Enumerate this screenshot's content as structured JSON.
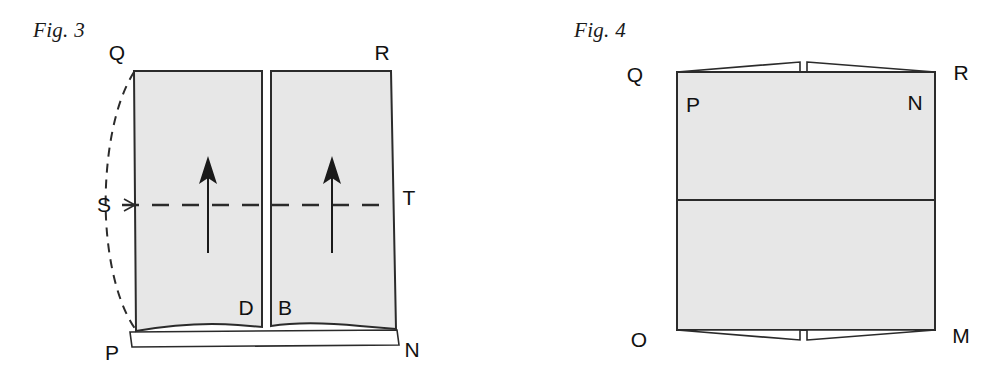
{
  "plate": {
    "background_color": "#ffffff",
    "width": 982,
    "height": 380
  },
  "style": {
    "panel_fill": "#e7e7e7",
    "stroke_color": "#2b2b2b",
    "label_color": "#111111",
    "caption_color": "#1a1a1a"
  },
  "figures": [
    {
      "id": "figure-3",
      "caption": "Fig. 3",
      "description": "Two shaded vertical panels separated by a narrow central gap, each containing an upward arrow, crossed by a horizontal dashed centre line from S to T, with a dashed curved outline bulging to the left of edge QP.",
      "vertex_labels": [
        {
          "name": "Q",
          "text": "Q",
          "x": 117,
          "y": 60,
          "position": "outside-top-left"
        },
        {
          "name": "R",
          "text": "R",
          "x": 382,
          "y": 60,
          "position": "outside-top-right"
        },
        {
          "name": "S",
          "text": "S",
          "x": 104,
          "y": 212,
          "position": "outside-left-middle"
        },
        {
          "name": "T",
          "text": "T",
          "x": 409,
          "y": 205,
          "position": "outside-right-middle"
        },
        {
          "name": "D",
          "text": "D",
          "x": 246,
          "y": 315,
          "position": "inside-left-panel-bottom"
        },
        {
          "name": "B",
          "text": "B",
          "x": 278,
          "y": 315,
          "position": "inside-right-panel-bottom"
        },
        {
          "name": "P",
          "text": "P",
          "x": 112,
          "y": 357,
          "position": "outside-bottom-left"
        },
        {
          "name": "N",
          "text": "N",
          "x": 410,
          "y": 355,
          "position": "outside-bottom-right"
        }
      ],
      "arrows": [
        {
          "name": "left-panel-up-arrow",
          "direction": "up",
          "x": 208,
          "y_tail": 253,
          "y_head": 160
        },
        {
          "name": "right-panel-up-arrow",
          "direction": "up",
          "x": 332,
          "y_tail": 253,
          "y_head": 160
        }
      ],
      "dashed_centre_line": {
        "from": "S",
        "to": "T",
        "y": 205,
        "x_start": 122,
        "x_end": 392
      },
      "dashed_curve": {
        "name": "deflected-edge-curve",
        "from": "Q",
        "to": "P",
        "bulge": "left"
      }
    },
    {
      "id": "figure-4",
      "caption": "Fig. 4",
      "description": "A shaded rectangle split by a horizontal divider into an upper and a lower panel, with triangular flaps folded outward at top edge QR and bottom edge OM, each pair meeting at a narrow central notch.",
      "vertex_labels": [
        {
          "name": "Q",
          "text": "Q",
          "x": 144,
          "y": 82,
          "position": "outside-top-left"
        },
        {
          "name": "R",
          "text": "R",
          "x": 396,
          "y": 80,
          "position": "outside-top-right"
        },
        {
          "name": "P",
          "text": "P",
          "x": 198,
          "y": 110,
          "position": "inside-top-left"
        },
        {
          "name": "N",
          "text": "N",
          "x": 420,
          "y": 108,
          "position": "inside-top-right"
        },
        {
          "name": "O",
          "text": "O",
          "x": 148,
          "y": 347,
          "position": "outside-bottom-left"
        },
        {
          "name": "M",
          "text": "M",
          "x": 440,
          "y": 343,
          "position": "outside-bottom-right"
        }
      ],
      "divider": {
        "name": "horizontal-divider",
        "y": 200
      },
      "flaps": [
        {
          "name": "top-left-flap",
          "edge": "top",
          "side": "left"
        },
        {
          "name": "top-right-flap",
          "edge": "top",
          "side": "right"
        },
        {
          "name": "bottom-left-flap",
          "edge": "bottom",
          "side": "left"
        },
        {
          "name": "bottom-right-flap",
          "edge": "bottom",
          "side": "right"
        }
      ],
      "centre_notch": {
        "name": "centre-notch",
        "x": 312,
        "width": 7
      }
    }
  ]
}
